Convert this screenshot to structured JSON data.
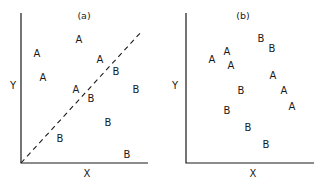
{
  "panels": [
    {
      "id": "a",
      "title": "(a)",
      "xlabel": "X",
      "ylabel": "Y",
      "axis": {
        "origin": [
          21,
          163
        ],
        "x_end": 148,
        "y_end": 13
      },
      "title_pos": [
        84,
        19
      ],
      "xlabel_pos": [
        87,
        177
      ],
      "ylabel_pos": [
        13,
        89
      ],
      "divider": {
        "from": [
          21,
          163
        ],
        "to": [
          142,
          31
        ],
        "style": "dashed"
      },
      "points": [
        {
          "label": "A",
          "x": 79,
          "y": 39
        },
        {
          "label": "A",
          "x": 37,
          "y": 53
        },
        {
          "label": "A",
          "x": 43,
          "y": 77
        },
        {
          "label": "A",
          "x": 100,
          "y": 59
        },
        {
          "label": "A",
          "x": 76,
          "y": 89
        },
        {
          "label": "B",
          "x": 116,
          "y": 71
        },
        {
          "label": "B",
          "x": 136,
          "y": 89
        },
        {
          "label": "B",
          "x": 91,
          "y": 98
        },
        {
          "label": "B",
          "x": 108,
          "y": 122
        },
        {
          "label": "B",
          "x": 60,
          "y": 138
        },
        {
          "label": "B",
          "x": 127,
          "y": 154
        }
      ]
    },
    {
      "id": "b",
      "title": "(b)",
      "xlabel": "X",
      "ylabel": "Y",
      "axis": {
        "origin": [
          186,
          163
        ],
        "x_end": 314,
        "y_end": 13
      },
      "title_pos": [
        243,
        19
      ],
      "xlabel_pos": [
        253,
        177
      ],
      "ylabel_pos": [
        175,
        89
      ],
      "divider": null,
      "points": [
        {
          "label": "A",
          "x": 212,
          "y": 59
        },
        {
          "label": "A",
          "x": 227,
          "y": 51
        },
        {
          "label": "A",
          "x": 231,
          "y": 65
        },
        {
          "label": "A",
          "x": 273,
          "y": 75
        },
        {
          "label": "A",
          "x": 284,
          "y": 90
        },
        {
          "label": "A",
          "x": 292,
          "y": 106
        },
        {
          "label": "B",
          "x": 261,
          "y": 38
        },
        {
          "label": "B",
          "x": 272,
          "y": 48
        },
        {
          "label": "B",
          "x": 241,
          "y": 90
        },
        {
          "label": "B",
          "x": 227,
          "y": 110
        },
        {
          "label": "B",
          "x": 248,
          "y": 127
        },
        {
          "label": "B",
          "x": 266,
          "y": 144
        }
      ]
    }
  ]
}
